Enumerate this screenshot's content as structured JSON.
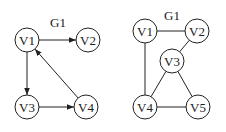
{
  "graphs": [
    {
      "label": "G1",
      "directed": true,
      "label_pos": [
        58,
        23
      ],
      "nodes": [
        {
          "id": "V1",
          "x": 27,
          "y": 40
        },
        {
          "id": "V2",
          "x": 88,
          "y": 40
        },
        {
          "id": "V3",
          "x": 27,
          "y": 107
        },
        {
          "id": "V4",
          "x": 86,
          "y": 107
        }
      ],
      "edges": [
        {
          "from": "V1",
          "to": "V2"
        },
        {
          "from": "V1",
          "to": "V3"
        },
        {
          "from": "V3",
          "to": "V4"
        },
        {
          "from": "V4",
          "to": "V1"
        }
      ]
    },
    {
      "label": "G1",
      "directed": false,
      "label_pos": [
        172,
        16
      ],
      "nodes": [
        {
          "id": "V1",
          "x": 145,
          "y": 31
        },
        {
          "id": "V2",
          "x": 197,
          "y": 31
        },
        {
          "id": "V3",
          "x": 172,
          "y": 61
        },
        {
          "id": "V4",
          "x": 145,
          "y": 107
        },
        {
          "id": "V5",
          "x": 198,
          "y": 107
        }
      ],
      "edges": [
        {
          "from": "V1",
          "to": "V2"
        },
        {
          "from": "V1",
          "to": "V4"
        },
        {
          "from": "V2",
          "to": "V3"
        },
        {
          "from": "V3",
          "to": "V4"
        },
        {
          "from": "V3",
          "to": "V5"
        },
        {
          "from": "V4",
          "to": "V5"
        }
      ]
    }
  ],
  "node_radius": 12,
  "colors": {
    "stroke": "#222222",
    "background": "#ffffff"
  }
}
